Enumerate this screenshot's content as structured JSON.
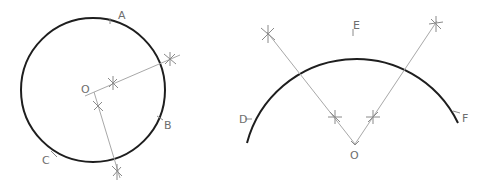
{
  "figures": [
    {
      "id": "circle-figure",
      "type": "circle",
      "center": [
        93,
        90
      ],
      "radius": 72,
      "labels": {
        "O": {
          "text": "O",
          "x": 81,
          "y": 93
        },
        "A": {
          "text": "A",
          "x": 118,
          "y": 19
        },
        "B": {
          "text": "B",
          "x": 164,
          "y": 129
        },
        "C": {
          "text": "C",
          "x": 42,
          "y": 164
        }
      },
      "construction_lines": [
        {
          "from": [
            85,
            96
          ],
          "to": [
            180,
            55
          ]
        },
        {
          "from": [
            94,
            92
          ],
          "to": [
            120,
            178
          ]
        }
      ],
      "arc_marks": [
        {
          "x": 113,
          "y": 83
        },
        {
          "x": 170,
          "y": 59
        },
        {
          "x": 98,
          "y": 106
        },
        {
          "x": 117,
          "y": 172
        }
      ],
      "point_ticks": [
        {
          "x": 110,
          "y": 21
        },
        {
          "x": 160,
          "y": 118
        },
        {
          "x": 54,
          "y": 154
        }
      ]
    },
    {
      "id": "arc-figure",
      "type": "arc",
      "center": [
        355,
        145
      ],
      "radius": 113,
      "labels": {
        "O": {
          "text": "O",
          "x": 350,
          "y": 159
        },
        "E": {
          "text": "E",
          "x": 353,
          "y": 29
        },
        "D": {
          "text": "D",
          "x": 239,
          "y": 123
        },
        "F": {
          "text": "F",
          "x": 462,
          "y": 122
        }
      },
      "construction_lines": [
        {
          "from": [
            355,
            144
          ],
          "to": [
            267,
            32
          ]
        },
        {
          "from": [
            355,
            144
          ],
          "to": [
            437,
            21
          ]
        }
      ],
      "arc_marks": [
        {
          "x": 268,
          "y": 34
        },
        {
          "x": 335,
          "y": 117
        },
        {
          "x": 373,
          "y": 117
        },
        {
          "x": 436,
          "y": 24
        }
      ],
      "point_ticks": [
        {
          "x": 353,
          "y": 32
        },
        {
          "x": 248,
          "y": 119
        },
        {
          "x": 457,
          "y": 112
        }
      ]
    }
  ],
  "colors": {
    "arc_stroke": "#1e1e1e",
    "construction_stroke": "#a8a8a8",
    "label_fill": "#6e6e6e"
  }
}
